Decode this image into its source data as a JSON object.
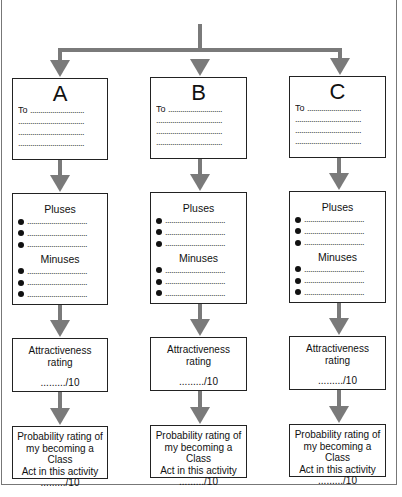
{
  "diagram": {
    "type": "decision-flowchart",
    "columns": [
      {
        "letter": "A",
        "to_label": "To",
        "to_line": "...........................",
        "blank_line": ".................................",
        "pluses_heading": "Pluses",
        "minuses_heading": "Minuses",
        "bullet_line": "..............................",
        "attractiveness_line1": "Attractiveness",
        "attractiveness_line2": "rating",
        "attractiveness_score": "........./10",
        "probability_line1": "Probability rating of",
        "probability_line2": "my becoming a Class",
        "probability_line3": "Act in this activity",
        "probability_score": "........./10"
      },
      {
        "letter": "B",
        "to_label": "To",
        "to_line": "...........................",
        "blank_line": ".................................",
        "pluses_heading": "Pluses",
        "minuses_heading": "Minuses",
        "bullet_line": "..............................",
        "attractiveness_line1": "Attractiveness",
        "attractiveness_line2": "rating",
        "attractiveness_score": "........./10",
        "probability_line1": "Probability rating of",
        "probability_line2": "my becoming a Class",
        "probability_line3": "Act in this activity",
        "probability_score": "........./10"
      },
      {
        "letter": "C",
        "to_label": "To",
        "to_line": "...........................",
        "blank_line": ".................................",
        "pluses_heading": "Pluses",
        "minuses_heading": "Minuses",
        "bullet_line": "..............................",
        "attractiveness_line1": "Attractiveness",
        "attractiveness_line2": "rating",
        "attractiveness_score": "........./10",
        "probability_line1": "Probability rating of",
        "probability_line2": "my becoming a Class",
        "probability_line3": "Act in this activity",
        "probability_score": "........./10"
      }
    ],
    "colors": {
      "arrow": "#7a7a7a",
      "box_border": "#222222",
      "frame": "#777777"
    }
  }
}
